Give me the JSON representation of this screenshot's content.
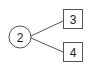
{
  "diagram": {
    "type": "tree",
    "root": {
      "label": "2",
      "shape": "circle"
    },
    "children": [
      {
        "label": "3",
        "shape": "square"
      },
      {
        "label": "4",
        "shape": "square"
      }
    ],
    "edges": [
      {
        "from": "2",
        "to": "3"
      },
      {
        "from": "2",
        "to": "4"
      }
    ],
    "colors": {
      "stroke": "#555555",
      "text": "#222222",
      "background": "#ffffff"
    }
  }
}
